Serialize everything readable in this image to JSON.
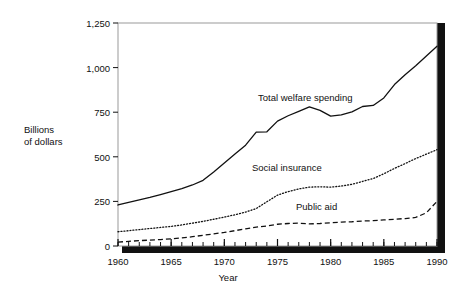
{
  "figure": {
    "type": "line-chart",
    "y_axis_title_line1": "Billions",
    "y_axis_title_line2": "of dollars",
    "x_axis_title": "Year"
  },
  "chart_data": {
    "type": "line",
    "title": "",
    "xlabel": "Year",
    "ylabel": "Billions of dollars",
    "xlim": [
      1960,
      1990
    ],
    "ylim": [
      0,
      1250
    ],
    "xticks": [
      1960,
      1965,
      1970,
      1975,
      1980,
      1985,
      1990
    ],
    "xtick_labels": [
      "1960",
      "1965",
      "1970",
      "1975",
      "1980",
      "1985",
      "1990"
    ],
    "yticks": [
      0,
      250,
      500,
      750,
      1000,
      1250
    ],
    "ytick_labels": [
      "0",
      "250",
      "500",
      "750",
      "1,000",
      "1,250"
    ],
    "minor_xtick_interval": 1,
    "grid": false,
    "legend": "inline-annotations",
    "x": [
      1960,
      1961,
      1962,
      1963,
      1964,
      1965,
      1966,
      1967,
      1968,
      1969,
      1970,
      1971,
      1972,
      1973,
      1974,
      1975,
      1976,
      1977,
      1978,
      1979,
      1980,
      1981,
      1982,
      1983,
      1984,
      1985,
      1986,
      1987,
      1988,
      1989,
      1990
    ],
    "series": [
      {
        "name": "Total welfare spending",
        "line_style": "solid",
        "color": "#111111",
        "values": [
          230,
          245,
          258,
          272,
          288,
          305,
          322,
          342,
          368,
          415,
          465,
          515,
          565,
          638,
          640,
          700,
          730,
          755,
          780,
          760,
          728,
          735,
          752,
          782,
          788,
          830,
          905,
          960,
          1010,
          1065,
          1120
        ]
      },
      {
        "name": "Social insurance",
        "line_style": "dotted",
        "color": "#111111",
        "values": [
          80,
          86,
          92,
          98,
          104,
          110,
          118,
          128,
          138,
          150,
          162,
          175,
          190,
          210,
          248,
          285,
          305,
          320,
          330,
          332,
          330,
          336,
          346,
          362,
          378,
          405,
          435,
          462,
          490,
          515,
          540
        ]
      },
      {
        "name": "Public aid",
        "line_style": "dashed",
        "color": "#111111",
        "values": [
          22,
          26,
          30,
          33,
          36,
          40,
          45,
          52,
          60,
          68,
          76,
          86,
          96,
          106,
          112,
          122,
          126,
          128,
          124,
          126,
          130,
          134,
          136,
          140,
          142,
          146,
          150,
          154,
          160,
          186,
          250
        ]
      }
    ]
  }
}
